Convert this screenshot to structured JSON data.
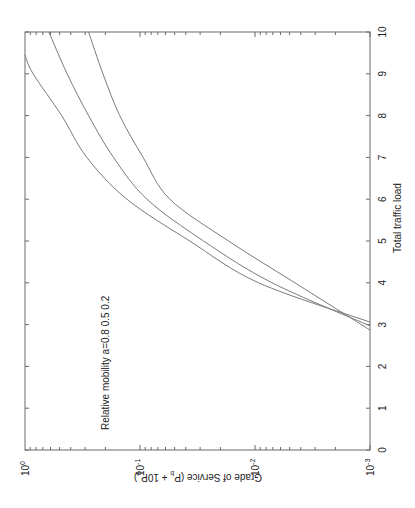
{
  "chart_data": {
    "type": "line",
    "orientation_note_rotated_90deg": true,
    "title": "",
    "xlabel": "Total traffic load",
    "ylabel": "Grade of Service (P_b + 10P_d)",
    "ylabel_parts": {
      "main": "Grade of Service (P",
      "sub1": "b",
      "mid": " + 10P",
      "sub2": "d",
      "end": ")"
    },
    "xlim": [
      0,
      10
    ],
    "ylim": [
      0.001,
      1
    ],
    "yscale": "log",
    "grid": false,
    "x_ticks": [
      "0",
      "1",
      "2",
      "3",
      "4",
      "5",
      "6",
      "7",
      "8",
      "9",
      "10"
    ],
    "y_ticks": [
      {
        "base": "10",
        "exp": "0"
      },
      {
        "base": "10",
        "exp": "-1"
      },
      {
        "base": "10",
        "exp": "-2"
      },
      {
        "base": "10",
        "exp": "-3"
      }
    ],
    "annotation": "Relative mobility a=0.8  0.5  0.2",
    "series": [
      {
        "name": "a=0.8",
        "x": [
          3.06,
          4,
          5,
          6,
          7,
          8,
          9,
          9.45
        ],
        "y": [
          0.001,
          0.0093,
          0.037,
          0.13,
          0.29,
          0.48,
          0.85,
          1.0
        ]
      },
      {
        "name": "a=0.5",
        "x": [
          2.97,
          4,
          5,
          6,
          7,
          8,
          9,
          10
        ],
        "y": [
          0.001,
          0.0071,
          0.028,
          0.087,
          0.17,
          0.28,
          0.43,
          0.62
        ]
      },
      {
        "name": "a=0.2",
        "x": [
          2.87,
          4,
          5,
          6,
          7,
          8,
          9,
          10
        ],
        "y": [
          0.001,
          0.0045,
          0.017,
          0.055,
          0.094,
          0.15,
          0.21,
          0.28
        ]
      }
    ]
  }
}
